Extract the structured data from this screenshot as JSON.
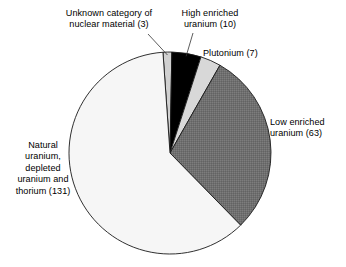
{
  "chart_data": {
    "type": "pie",
    "title": "",
    "subtitle": "",
    "xlabel": "",
    "ylabel": "",
    "legend_position": "none",
    "grid": false,
    "total": 214,
    "value_unit": "count",
    "start_angle_deg": -4,
    "direction": "clockwise",
    "categories": [
      "Unknown category of nuclear material",
      "High enriched uranium",
      "Plutonium",
      "Low enriched uranium",
      "Natural uranium, depleted uranium and thorium"
    ],
    "values": [
      3,
      10,
      7,
      63,
      131
    ],
    "slices": [
      {
        "name": "unknown-category",
        "label_text": "Unknown category of\nnuclear material (3)",
        "value": 3,
        "percent": 1.4,
        "angle_deg": 5.0,
        "color": "#d0d0d0",
        "has_leader_line": true
      },
      {
        "name": "high-enriched-uranium",
        "label_text": "High enriched\nuranium (10)",
        "value": 10,
        "percent": 4.7,
        "angle_deg": 16.8,
        "color": "#000000",
        "has_leader_line": true
      },
      {
        "name": "plutonium",
        "label_text": "Plutonium (7)",
        "value": 7,
        "percent": 3.3,
        "angle_deg": 11.8,
        "color": "#d8d8d8",
        "has_leader_line": false
      },
      {
        "name": "low-enriched-uranium",
        "label_text": "Low enriched\nuranium (63)",
        "value": 63,
        "percent": 29.4,
        "angle_deg": 106.0,
        "color": "#6f6f6f",
        "has_leader_line": false
      },
      {
        "name": "natural-uranium",
        "label_text": "Natural\nuranium,\ndepleted\nuranium and\nthorium (131)",
        "value": 131,
        "percent": 61.2,
        "angle_deg": 220.3,
        "color": "#f6f6f6",
        "has_leader_line": false
      }
    ],
    "geometry": {
      "center_x": 170,
      "center_y": 153,
      "radius": 101
    },
    "colors": {
      "background": "#ffffff",
      "outline": "#1a1a1a",
      "text": "#000000",
      "leader_line": "#333333"
    }
  }
}
